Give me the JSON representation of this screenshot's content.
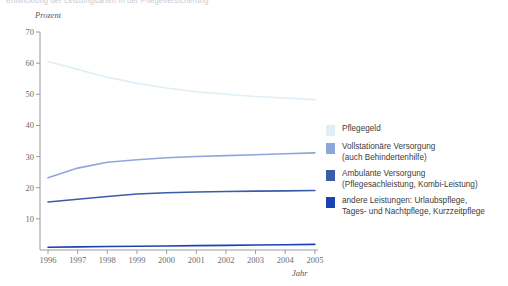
{
  "clipped_header": "Entwicklung der Leistungsarten in der Pflegeversicherung",
  "axes": {
    "ylabel": "Prozent",
    "xlabel": "Jahr",
    "yticks": [
      "70",
      "60",
      "50",
      "40",
      "30",
      "20",
      "10"
    ],
    "xticks": [
      "1996",
      "1997",
      "1998",
      "1999",
      "2000",
      "2001",
      "2002",
      "2003",
      "2004",
      "2005"
    ]
  },
  "legend": {
    "items": [
      {
        "label": "Pflegegeld",
        "color": "#dfeef7"
      },
      {
        "label": "Vollstationäre Versorgung\n(auch Behindertenhilfe)",
        "color": "#8fa6dc"
      },
      {
        "label": "Ambulante Versorgung\n(Pflegesachleistung, Kombi-Leistung)",
        "color": "#3b5bab"
      },
      {
        "label": "andere Leistungen: Urlaubspflege,\nTages- und Nachtpflege, Kurzzeitpflege",
        "color": "#1b42b5"
      }
    ]
  },
  "chart_data": {
    "type": "line",
    "title": "",
    "xlabel": "Jahr",
    "ylabel": "Prozent",
    "ylim": [
      0,
      70
    ],
    "grid": false,
    "legend_position": "right",
    "x": [
      1996,
      1997,
      1998,
      1999,
      2000,
      2001,
      2002,
      2003,
      2004,
      2005
    ],
    "series": [
      {
        "name": "Pflegegeld",
        "color": "#dfeef7",
        "values": [
          60.5,
          58.0,
          55.5,
          53.5,
          52.0,
          50.8,
          50.0,
          49.3,
          48.8,
          48.3
        ]
      },
      {
        "name": "Vollstationäre Versorgung (auch Behindertenhilfe)",
        "color": "#8fa6dc",
        "values": [
          23.2,
          26.3,
          28.2,
          29.0,
          29.6,
          30.0,
          30.3,
          30.6,
          30.9,
          31.2
        ]
      },
      {
        "name": "Ambulante Versorgung (Pflegesachleistung, Kombi-Leistung)",
        "color": "#3b5bab",
        "values": [
          15.4,
          16.3,
          17.2,
          18.0,
          18.4,
          18.6,
          18.8,
          18.9,
          19.0,
          19.1
        ]
      },
      {
        "name": "andere Leistungen: Urlaubspflege, Tages- und Nachtpflege, Kurzzeitpflege",
        "color": "#1b42b5",
        "values": [
          0.9,
          1.0,
          1.1,
          1.2,
          1.3,
          1.4,
          1.5,
          1.6,
          1.7,
          1.8
        ]
      }
    ]
  }
}
